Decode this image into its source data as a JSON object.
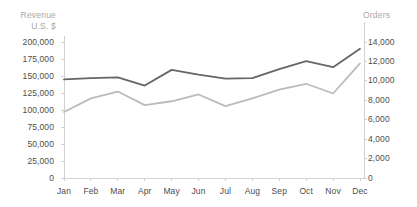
{
  "chart_data": {
    "type": "line",
    "title": "",
    "categories": [
      "Jan",
      "Feb",
      "Mar",
      "Apr",
      "May",
      "Jun",
      "Jul",
      "Aug",
      "Sep",
      "Oct",
      "Nov",
      "Dec"
    ],
    "series": [
      {
        "name": "Revenue U.S. $",
        "axis": "left",
        "color": "#666666",
        "values": [
          145000,
          147000,
          148000,
          136000,
          159000,
          152000,
          146000,
          147000,
          160000,
          172000,
          163000,
          190000
        ]
      },
      {
        "name": "Orders",
        "axis": "right",
        "color": "#bbbbbb",
        "values": [
          6800,
          8200,
          8900,
          7500,
          7900,
          8600,
          7400,
          8200,
          9100,
          9700,
          8700,
          11800
        ]
      }
    ],
    "xlabel": "",
    "ylabel": "Revenue U.S. $",
    "y2label": "Orders",
    "ylim": [
      0,
      200000
    ],
    "y2lim": [
      0,
      14000
    ],
    "yticks": [
      "0",
      "25,000",
      "50,000",
      "75,000",
      "100,000",
      "125,000",
      "150,000",
      "175,000",
      "200,000"
    ],
    "ytick_values": [
      0,
      25000,
      50000,
      75000,
      100000,
      125000,
      150000,
      175000,
      200000
    ],
    "y2ticks": [
      "0",
      "2,000",
      "4,000",
      "6,000",
      "8,000",
      "10,000",
      "12,000",
      "14,000"
    ],
    "y2tick_values": [
      0,
      2000,
      4000,
      6000,
      8000,
      10000,
      12000,
      14000
    ],
    "grid": false,
    "legend": "none"
  },
  "axis_titles": {
    "left": "Revenue\nU.S. $",
    "right": "Orders"
  },
  "colors": {
    "revenue_line": "#666666",
    "orders_line": "#bbbbbb",
    "axis": "#d0d0d0",
    "tick_text": "#4d4d4d",
    "title_text": "#a8a8a8",
    "background": "#ffffff"
  }
}
